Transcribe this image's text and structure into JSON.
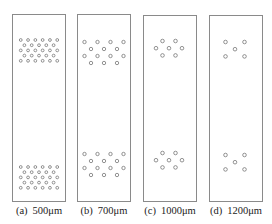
{
  "figure": {
    "panels": [
      {
        "id": "a",
        "label": "(a)",
        "value": "500μm",
        "box": {
          "x": 12,
          "y": 14,
          "w": 54,
          "h": 188
        },
        "clusters": {
          "top_y": 40,
          "bottom_y": 167,
          "rows": [
            6,
            5,
            6,
            5,
            6
          ],
          "dx": 7.3,
          "dy": 5.2,
          "r": 1.4,
          "cx": 39
        }
      },
      {
        "id": "b",
        "label": "(b)",
        "value": "700μm",
        "box": {
          "x": 77,
          "y": 14,
          "w": 54,
          "h": 188
        },
        "clusters": {
          "top_y": 42,
          "bottom_y": 154,
          "rows": [
            4,
            3,
            4,
            3
          ],
          "dx": 13,
          "dy": 7,
          "r": 1.7,
          "cx": 104
        }
      },
      {
        "id": "c",
        "label": "(c)",
        "value": "1000μm",
        "box": {
          "x": 143,
          "y": 15,
          "w": 54,
          "h": 187
        },
        "clusters": {
          "top_y": 41,
          "bottom_y": 153,
          "rows": [
            2,
            3,
            2
          ],
          "dx": 13,
          "dy": 7.2,
          "r": 1.8,
          "cx": 169
        }
      },
      {
        "id": "d",
        "label": "(d)",
        "value": "1200μm",
        "box": {
          "x": 209,
          "y": 15,
          "w": 54,
          "h": 187
        },
        "clusters": {
          "top_y": 42,
          "bottom_y": 155,
          "rows": [
            2,
            1,
            2
          ],
          "dx": 19,
          "dy": 7.2,
          "r": 1.8,
          "cx": 235
        }
      }
    ],
    "stroke_color": "#8a8a8a",
    "hole_color": "#666666"
  }
}
